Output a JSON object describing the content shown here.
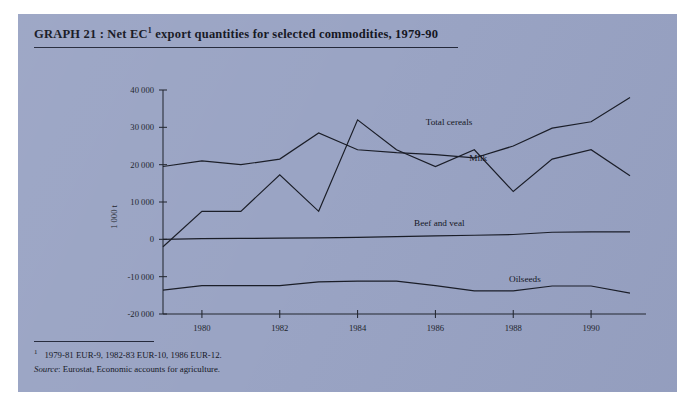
{
  "figure": {
    "title_prefix": "GRAPH 21 : Net EC",
    "title_superscript": "1",
    "title_rest": " export quantities for selected commodities, 1979-90",
    "panel_color": "#9aa4c4",
    "ink_color": "#1a1d27"
  },
  "footnotes": {
    "marker": "1",
    "note_1": "1979-81 EUR-9, 1982-83 EUR-10, 1986 EUR-12.",
    "source_word": "Source",
    "source_text": ": Eurostat, Economic accounts for agriculture."
  },
  "chart_data": {
    "type": "line",
    "xlabel": "",
    "ylabel": "1 000 t",
    "x": [
      1979,
      1980,
      1981,
      1982,
      1983,
      1984,
      1985,
      1986,
      1987,
      1988,
      1989,
      1990,
      1991
    ],
    "xlim": [
      1979,
      1991
    ],
    "ylim": [
      -20000,
      40000
    ],
    "grid": false,
    "legend": "inline-labels",
    "x_ticks": [
      "1980",
      "1982",
      "1984",
      "1986",
      "1988",
      "1990"
    ],
    "x_tick_values": [
      1980,
      1982,
      1984,
      1986,
      1988,
      1990
    ],
    "y_ticks": [
      "40 000",
      "30 000",
      "20 000",
      "10 000",
      "0",
      "-10 000",
      "-20 000"
    ],
    "y_tick_values": [
      40000,
      30000,
      20000,
      10000,
      0,
      -10000,
      -20000
    ],
    "series": [
      {
        "name": "Total cereals",
        "label": "Total cereals",
        "label_x": 1986.35,
        "label_y": 30500,
        "values": [
          -2000,
          7500,
          7500,
          17300,
          7500,
          32000,
          24000,
          19500,
          24000,
          12800,
          21500,
          24000,
          17000
        ]
      },
      {
        "name": "Milk",
        "label": "Milk",
        "label_x": 1987.1,
        "label_y": 20900,
        "values": [
          19500,
          21000,
          20000,
          21500,
          28500,
          24000,
          23200,
          22700,
          21800,
          25000,
          29800,
          31500,
          38000
        ]
      },
      {
        "name": "Beef and veal",
        "label": "Beef and veal",
        "label_x": 1986.1,
        "label_y": 3600,
        "values": [
          0,
          200,
          250,
          300,
          400,
          500,
          700,
          900,
          1100,
          1300,
          1900,
          2000,
          2000
        ]
      },
      {
        "name": "Oilseeds",
        "label": "Oilseeds",
        "label_x": 1988.3,
        "label_y": -11400,
        "values": [
          -13600,
          -12400,
          -12400,
          -12400,
          -11400,
          -11200,
          -11200,
          -12400,
          -13800,
          -13800,
          -12500,
          -12500,
          -14400
        ]
      }
    ]
  }
}
